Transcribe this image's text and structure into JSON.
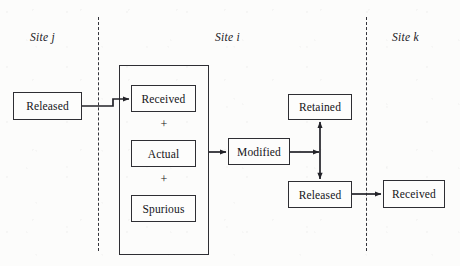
{
  "figure": {
    "background_color": "#fcfcfb",
    "stroke_color": "#2e2e33",
    "text_color": "#141418"
  },
  "site_labels": [
    {
      "id": "site-j",
      "text": "Site j",
      "x": 30,
      "y": 31
    },
    {
      "id": "site-i",
      "text": "Site i",
      "x": 215,
      "y": 31
    },
    {
      "id": "site-k",
      "text": "Site k",
      "x": 392,
      "y": 31
    }
  ],
  "dividers": [
    {
      "id": "divider-j-i",
      "x": 98,
      "y": 17,
      "height": 234
    },
    {
      "id": "divider-i-k",
      "x": 366,
      "y": 17,
      "height": 234
    }
  ],
  "group_box": {
    "id": "site-i-group",
    "x": 119,
    "y": 65,
    "width": 90,
    "height": 190
  },
  "nodes": [
    {
      "id": "released-site-j",
      "label": "Released",
      "x": 13,
      "y": 92,
      "width": 69,
      "height": 28
    },
    {
      "id": "received-site-i",
      "label": "Received",
      "x": 131,
      "y": 85,
      "width": 65,
      "height": 27
    },
    {
      "id": "actual-site-i",
      "label": "Actual",
      "x": 131,
      "y": 140,
      "width": 65,
      "height": 27
    },
    {
      "id": "spurious-site-i",
      "label": "Spurious",
      "x": 131,
      "y": 195,
      "width": 65,
      "height": 27
    },
    {
      "id": "modified-site-i",
      "label": "Modified",
      "x": 228,
      "y": 138,
      "width": 62,
      "height": 27
    },
    {
      "id": "retained-site-i",
      "label": "Retained",
      "x": 288,
      "y": 94,
      "width": 64,
      "height": 26
    },
    {
      "id": "released-site-i",
      "label": "Released",
      "x": 288,
      "y": 181,
      "width": 64,
      "height": 27
    },
    {
      "id": "received-site-k",
      "label": "Received",
      "x": 383,
      "y": 180,
      "width": 62,
      "height": 28
    }
  ],
  "operators": [
    {
      "id": "plus-received-actual",
      "symbol": "+",
      "x": 154,
      "y": 117
    },
    {
      "id": "plus-actual-spurious",
      "symbol": "+",
      "x": 154,
      "y": 172
    }
  ],
  "edges": [
    {
      "id": "edge-released-j-to-received-i",
      "from": "released-site-j",
      "to": "received-site-i",
      "x1": 82,
      "y1": 106,
      "x2": 131,
      "y2": 99,
      "kind": "single-arrow"
    },
    {
      "id": "edge-group-to-modified",
      "from": "site-i-group",
      "to": "modified-site-i",
      "x1": 209,
      "y1": 152,
      "x2": 228,
      "y2": 152,
      "kind": "single-arrow"
    },
    {
      "id": "edge-modified-to-junction",
      "from": "modified-site-i",
      "to": "retained-released-link",
      "x1": 290,
      "y1": 152,
      "x2": 320,
      "y2": 152,
      "kind": "single-arrow"
    },
    {
      "id": "edge-retained-released-link",
      "from": "released-site-i",
      "to": "retained-site-i",
      "x1": 320,
      "y1": 181,
      "x2": 320,
      "y2": 120,
      "kind": "double-arrow"
    },
    {
      "id": "edge-released-i-to-received-k",
      "from": "released-site-i",
      "to": "received-site-k",
      "x1": 352,
      "y1": 194,
      "x2": 383,
      "y2": 194,
      "kind": "single-arrow"
    }
  ]
}
